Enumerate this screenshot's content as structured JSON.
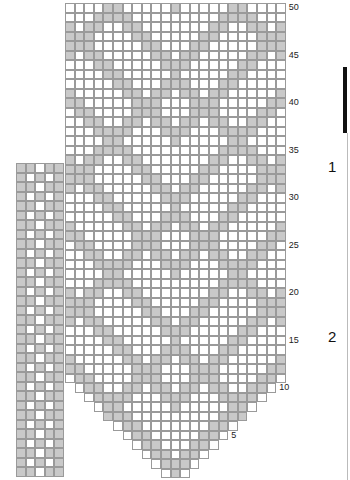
{
  "chart": {
    "type": "knitting-chart",
    "main_grid": {
      "columns": 23,
      "rows": 50,
      "center_column": 11,
      "cell_w": 9.6,
      "cell_h": 9.5,
      "row_spans_bottom": {
        "10": [
          1,
          21
        ],
        "9": [
          2,
          20
        ],
        "8": [
          3,
          19
        ],
        "7": [
          4,
          18
        ],
        "6": [
          5,
          17
        ],
        "5": [
          6,
          16
        ],
        "4": [
          7,
          15
        ],
        "3": [
          8,
          14
        ],
        "2": [
          9,
          13
        ],
        "1": [
          10,
          12
        ]
      },
      "pattern_rule": {
        "b_mod": 7,
        "b_set": [
          1,
          2
        ],
        "a_mod": 14,
        "a_set": [
          0,
          1
        ]
      },
      "colors": {
        "filled": "#c9c9c9",
        "empty": "#ffffff",
        "line": "#9a9a9a"
      }
    },
    "side_strip": {
      "columns": 5,
      "rows": 33,
      "row_patterns": [
        "##.##",
        "#.#.#"
      ]
    },
    "row_labels": [
      {
        "label": "50",
        "row": 50
      },
      {
        "label": "45",
        "row": 45
      },
      {
        "label": "40",
        "row": 40
      },
      {
        "label": "35",
        "row": 35
      },
      {
        "label": "30",
        "row": 30
      },
      {
        "label": "25",
        "row": 25
      },
      {
        "label": "20",
        "row": 20
      },
      {
        "label": "15",
        "row": 15
      },
      {
        "label": "10",
        "row": 10
      },
      {
        "label": "5",
        "row": 5
      }
    ],
    "section_labels": [
      {
        "label": "1",
        "x": 328,
        "y": 158
      },
      {
        "label": "2",
        "x": 328,
        "y": 328
      }
    ]
  }
}
